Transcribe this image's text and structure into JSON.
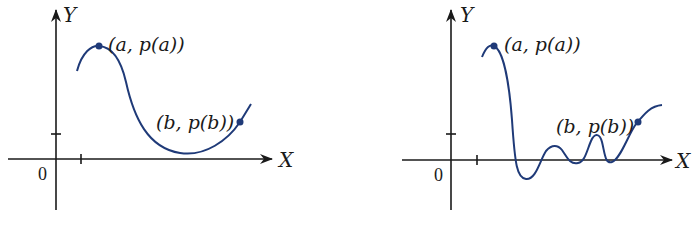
{
  "colors": {
    "axis": "#1a1a1a",
    "curve": "#1f3a78",
    "point": "#1f3a78"
  },
  "graphs": [
    {
      "id": "left",
      "y_axis_label": "Y",
      "x_axis_label": "X",
      "origin_label": "0",
      "point_a_label": "(a, p(a))",
      "point_b_label": "(b, p(b))"
    },
    {
      "id": "right",
      "y_axis_label": "Y",
      "x_axis_label": "X",
      "origin_label": "0",
      "point_a_label": "(a, p(a))",
      "point_b_label": "(b, p(b))"
    }
  ]
}
